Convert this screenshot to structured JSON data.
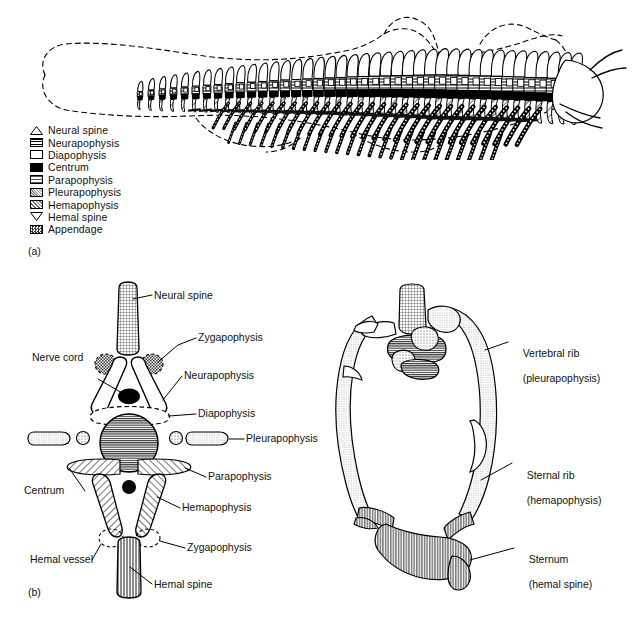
{
  "figure": {
    "panel_a_tag": "(a)",
    "panel_b_tag": "(b)"
  },
  "legend": {
    "items": [
      {
        "label": "Neural spine",
        "swatch": "triangle-up-outline"
      },
      {
        "label": "Neurapophysis",
        "swatch": "horizontal-lines"
      },
      {
        "label": "Diapophysis",
        "swatch": "white-outline"
      },
      {
        "label": "Centrum",
        "swatch": "solid-black"
      },
      {
        "label": "Parapophysis",
        "swatch": "horizontal-lines-light"
      },
      {
        "label": "Pleurapophysis",
        "swatch": "fine-stipple"
      },
      {
        "label": "Hemapophysis",
        "swatch": "coarse-stipple"
      },
      {
        "label": "Hemal spine",
        "swatch": "triangle-down-outline"
      },
      {
        "label": "Appendage",
        "swatch": "dark-checker"
      }
    ]
  },
  "panel_b": {
    "labels": [
      {
        "name": "neural-spine",
        "text": "Neural spine"
      },
      {
        "name": "zygapophysis-top",
        "text": "Zygapophysis"
      },
      {
        "name": "nerve-cord",
        "text": "Nerve cord"
      },
      {
        "name": "neurapophysis",
        "text": "Neurapophysis"
      },
      {
        "name": "diapophysis",
        "text": "Diapophysis"
      },
      {
        "name": "pleurapophysis",
        "text": "Pleurapophysis"
      },
      {
        "name": "parapophysis",
        "text": "Parapophysis"
      },
      {
        "name": "centrum",
        "text": "Centrum"
      },
      {
        "name": "hemapophysis",
        "text": "Hemapophysis"
      },
      {
        "name": "hemal-vessel",
        "text": "Hemal vessel"
      },
      {
        "name": "zygapophysis-bot",
        "text": "Zygapophysis"
      },
      {
        "name": "hemal-spine",
        "text": "Hemal spine"
      }
    ]
  },
  "panel_c": {
    "labels": [
      {
        "name": "vertebral-rib",
        "line1": "Vertebral rib",
        "line2": "(pleurapophysis)"
      },
      {
        "name": "sternal-rib",
        "line1": "Sternal rib",
        "line2": "(hemapophysis)"
      },
      {
        "name": "sternum",
        "line1": "Sternum",
        "line2": "(hemal spine)"
      }
    ]
  },
  "colors": {
    "ink": "#000000",
    "background": "#ffffff",
    "gray_fill": "#9a9a9a",
    "light_gray_fill": "#cfcfcf"
  }
}
